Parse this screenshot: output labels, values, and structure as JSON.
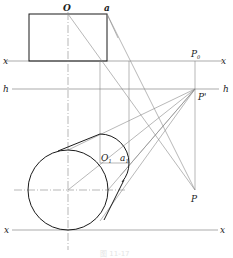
{
  "diagram": {
    "type": "perspective-construction",
    "labels": {
      "O": "O",
      "a": "a",
      "x_top_left": "x",
      "x_top_right": "x",
      "P0_main": "P",
      "P0_sub": "0",
      "h_left": "h",
      "h_right": "h",
      "P_prime": "P'",
      "O1_main": "O",
      "O1_sub": "1",
      "a1_main": "a",
      "a1_sub": "1",
      "P": "P",
      "x_bottom_left": "x",
      "x_bottom_right": "x"
    },
    "caption": "图 11-17",
    "colors": {
      "outline": "#1a1a1a",
      "construction": "#8a8a8a",
      "axis": "#777777"
    }
  }
}
